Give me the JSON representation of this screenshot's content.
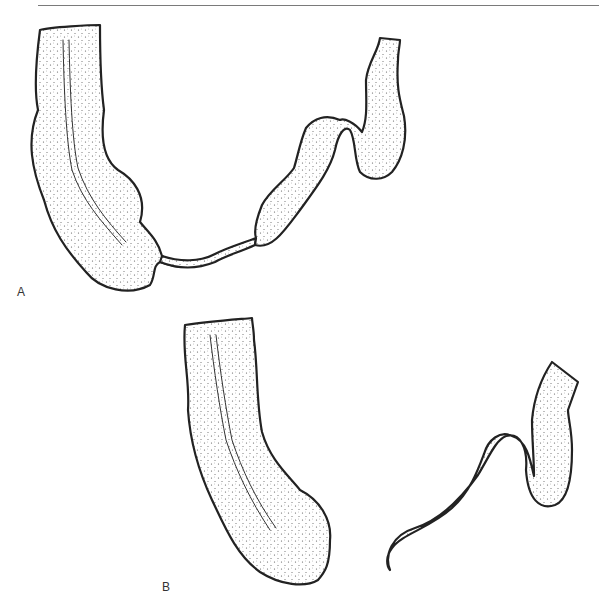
{
  "figure": {
    "top_rule": true,
    "panels": [
      {
        "label": "A",
        "description": "Bowel segments connected by a narrowed thin strand"
      },
      {
        "label": "B",
        "description": "Two separated bowel segments"
      }
    ]
  },
  "colors": {
    "ink": "#222222",
    "background": "#ffffff",
    "rule": "#7a7a7a"
  }
}
